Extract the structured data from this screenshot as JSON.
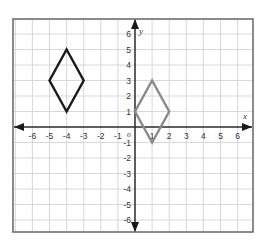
{
  "diagram": {
    "type": "coordinate-plane",
    "axes": {
      "x_label": "x",
      "y_label": "y",
      "origin_label": "o",
      "x_range": [
        -6,
        6
      ],
      "y_range": [
        -6,
        6
      ],
      "x_ticks": [
        "-6",
        "-5",
        "-4",
        "-3",
        "-2",
        "-1",
        "1",
        "2",
        "3",
        "4",
        "5",
        "6"
      ],
      "y_ticks": [
        "6",
        "5",
        "4",
        "3",
        "2",
        "1",
        "-1",
        "-2",
        "-3",
        "-4",
        "-5",
        "-6"
      ]
    },
    "shapes": [
      {
        "name": "black-rhombus",
        "color": "#1a1a1a",
        "vertices": [
          [
            -4,
            5
          ],
          [
            -3,
            3
          ],
          [
            -4,
            1
          ],
          [
            -5,
            3
          ]
        ]
      },
      {
        "name": "gray-rhombus",
        "color": "#8a8a8a",
        "vertices": [
          [
            1,
            3
          ],
          [
            2,
            1
          ],
          [
            1,
            -1
          ],
          [
            0,
            1
          ]
        ]
      }
    ],
    "colors": {
      "grid": "#d4d4d4",
      "frame": "#6e6e6e",
      "axis": "#2a2a2a"
    }
  }
}
